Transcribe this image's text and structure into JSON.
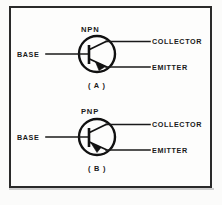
{
  "figure": {
    "title_present": false,
    "background_color": "#fbfbfa",
    "frame_color": "#2a2a2a",
    "ink_color": "#111111"
  },
  "diagrams": [
    {
      "id": "npn",
      "type_label": "NPN",
      "sub_label": "( A )",
      "terminals": {
        "base": "BASE",
        "collector": "COLLECTOR",
        "emitter": "EMITTER"
      },
      "arrow_direction": "outward",
      "arrow_on": "emitter"
    },
    {
      "id": "pnp",
      "type_label": "PNP",
      "sub_label": "( B )",
      "terminals": {
        "base": "BASE",
        "collector": "COLLECTOR",
        "emitter": "EMITTER"
      },
      "arrow_direction": "inward",
      "arrow_on": "emitter"
    }
  ]
}
